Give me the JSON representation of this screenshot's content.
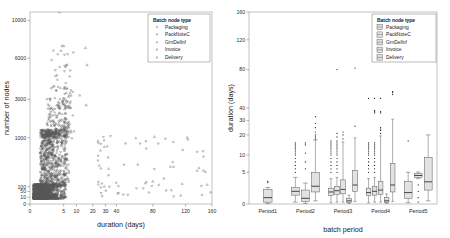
{
  "figure": {
    "panels": [
      "scatter-panel",
      "boxplot-panel"
    ]
  },
  "legend": {
    "title": "Batch node type",
    "items": [
      "Packaging",
      "PackNoteC",
      "GrnDelInf",
      "Invoice",
      "Delivery"
    ]
  },
  "chart_data": [
    {
      "type": "scatter",
      "title": "",
      "xlabel": "duration (days)",
      "ylabel": "number of nodes",
      "xticks": [
        0,
        5,
        10,
        20,
        30,
        40,
        80,
        120,
        160
      ],
      "yticks": [
        0,
        10,
        50,
        100,
        1000,
        3000,
        6000,
        10000
      ],
      "xlim": [
        0,
        160
      ],
      "ylim": [
        0,
        10000
      ],
      "xscale": "piecewise",
      "yscale": "piecewise",
      "grid": false,
      "legend_position": "top-right",
      "legend_title": "Batch node type",
      "series": [
        {
          "name": "Packaging",
          "marker": "triangle-up",
          "n_points": 520
        },
        {
          "name": "PackNoteC",
          "marker": "triangle-down",
          "n_points": 610
        },
        {
          "name": "GrnDelInf",
          "marker": "triangle-up",
          "n_points": 480
        },
        {
          "name": "Invoice",
          "marker": "triangle-down",
          "n_points": 540
        },
        {
          "name": "Delivery",
          "marker": "triangle-up",
          "n_points": 500
        }
      ],
      "notable_points": [
        {
          "x": 4.4,
          "y": 10500,
          "series": "GrnDelInf"
        },
        {
          "x": 5.0,
          "y": 7300,
          "series": "GrnDelInf"
        },
        {
          "x": 4.6,
          "y": 6800,
          "series": "Packaging"
        },
        {
          "x": 15.5,
          "y": 7100,
          "series": "GrnDelInf"
        },
        {
          "x": 16.5,
          "y": 5500,
          "series": "PackNoteC"
        },
        {
          "x": 12.0,
          "y": 3300,
          "series": "Invoice"
        },
        {
          "x": 16.0,
          "y": 2700,
          "series": "Delivery"
        },
        {
          "x": 82.0,
          "y": 1050,
          "series": "Delivery"
        },
        {
          "x": 50.0,
          "y": 900,
          "series": "Invoice"
        },
        {
          "x": 80.0,
          "y": 200,
          "series": "Delivery"
        },
        {
          "x": 158.0,
          "y": 45,
          "series": "Delivery"
        }
      ],
      "density_note": "dense cluster between 1-20 days and 10-1500 nodes"
    },
    {
      "type": "boxplot",
      "title": "",
      "xlabel": "batch period",
      "ylabel": "duration (days)",
      "categories": [
        "Period1",
        "Period2",
        "Period3",
        "Period4",
        "Period5"
      ],
      "yticks": [
        0,
        5,
        10,
        20,
        30,
        40,
        80,
        120,
        160
      ],
      "ylim": [
        0,
        160
      ],
      "yscale": "piecewise",
      "grid": false,
      "legend_position": "top-right",
      "legend_title": "Batch node type",
      "groups": [
        {
          "category": "Period1",
          "boxes": [
            {
              "series": "Delivery",
              "q1": 0.3,
              "median": 1.0,
              "q3": 2.3,
              "low": 0.1,
              "high": 2.6,
              "outliers": [
                3.4,
                3.6
              ]
            }
          ]
        },
        {
          "category": "Period2",
          "boxes": [
            {
              "series": "Packaging",
              "q1": 1.4,
              "median": 2.0,
              "q3": 2.6,
              "low": 0.3,
              "high": 4.2,
              "outliers": [
                5,
                6,
                7,
                8,
                9,
                10,
                11,
                12,
                13,
                14,
                15,
                16
              ]
            },
            {
              "series": "PackNoteC",
              "q1": 0.4,
              "median": 0.9,
              "q3": 2.2,
              "low": 0.1,
              "high": 3.3,
              "outliers": [
                6,
                8,
                11,
                15,
                16
              ]
            },
            {
              "series": "GrnDelInf",
              "q1": 1.9,
              "median": 2.8,
              "q3": 5.0,
              "low": 0.5,
              "high": 17.5,
              "outliers": [
                18,
                19,
                20,
                22,
                25,
                28,
                33
              ]
            }
          ]
        },
        {
          "category": "Period3",
          "boxes": [
            {
              "series": "Packaging",
              "q1": 1.3,
              "median": 1.9,
              "q3": 2.5,
              "low": 0.2,
              "high": 4.0,
              "outliers": [
                5,
                6,
                7,
                8,
                9,
                10,
                11,
                12,
                13,
                14,
                15,
                16,
                17
              ]
            },
            {
              "series": "PackNoteC",
              "q1": 1.5,
              "median": 2.1,
              "q3": 2.8,
              "low": 0.3,
              "high": 4.2,
              "outliers": [
                5,
                6,
                7,
                8,
                9,
                10,
                11,
                12,
                13,
                14,
                15,
                16,
                17,
                19,
                21,
                80
              ]
            },
            {
              "series": "GrnDelInf",
              "q1": 1.6,
              "median": 2.3,
              "q3": 3.8,
              "low": 0.3,
              "high": 16.5,
              "outliers": [
                18,
                20,
                22
              ]
            },
            {
              "series": "Invoice",
              "q1": 0.2,
              "median": 0.5,
              "q3": 0.9,
              "low": 0.05,
              "high": 1.4,
              "outliers": []
            },
            {
              "series": "Delivery",
              "q1": 2.0,
              "median": 3.0,
              "q3": 5.6,
              "low": 0.4,
              "high": 18.5,
              "outliers": [
                26,
                82
              ]
            }
          ]
        },
        {
          "category": "Period4",
          "boxes": [
            {
              "series": "Packaging",
              "q1": 1.3,
              "median": 1.8,
              "q3": 2.5,
              "low": 0.2,
              "high": 4.0,
              "outliers": [
                5,
                6,
                7,
                8,
                9,
                10,
                11,
                12,
                13,
                14,
                15,
                16,
                50
              ]
            },
            {
              "series": "PackNoteC",
              "q1": 1.4,
              "median": 2.0,
              "q3": 2.8,
              "low": 0.3,
              "high": 4.2,
              "outliers": [
                5,
                6,
                7,
                8,
                9,
                10,
                11,
                12,
                13,
                14,
                15,
                16,
                36,
                37,
                38,
                50
              ]
            },
            {
              "series": "GrnDelInf",
              "q1": 1.5,
              "median": 2.2,
              "q3": 3.6,
              "low": 0.3,
              "high": 19.5,
              "outliers": [
                21,
                23,
                24,
                25,
                36,
                37,
                50
              ]
            },
            {
              "series": "Invoice",
              "q1": 0.2,
              "median": 0.5,
              "q3": 1.0,
              "low": 0.05,
              "high": 1.6,
              "outliers": []
            },
            {
              "series": "Delivery",
              "q1": 1.9,
              "median": 3.0,
              "q3": 7.5,
              "low": 0.4,
              "high": 31.0,
              "outliers": [
                54,
                56,
                57
              ]
            }
          ]
        },
        {
          "category": "Period5",
          "boxes": [
            {
              "series": "Packaging",
              "q1": 0.9,
              "median": 1.8,
              "q3": 3.6,
              "low": 0.2,
              "high": 5.0,
              "outliers": [
                17
              ]
            },
            {
              "series": "PackNoteC",
              "q1": 4.2,
              "median": 4.5,
              "q3": 4.8,
              "low": 4.0,
              "high": 5.1,
              "outliers": [
                1.0,
                2.0,
                3.0,
                0.3
              ]
            },
            {
              "series": "Delivery",
              "q1": 2.2,
              "median": 3.5,
              "q3": 9.3,
              "low": 0.5,
              "high": 20.0,
              "outliers": []
            }
          ]
        }
      ]
    }
  ]
}
